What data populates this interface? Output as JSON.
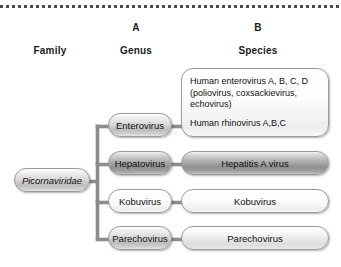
{
  "diagram": {
    "top_rule_style": "dotted",
    "columns": [
      {
        "letter": "",
        "header": "Family"
      },
      {
        "letter": "A",
        "header": "Genus"
      },
      {
        "letter": "B",
        "header": "Species"
      }
    ],
    "family": {
      "label": "Picornaviridae",
      "italic": true
    },
    "branches": [
      {
        "genus": "Enterovirus",
        "species_lines": [
          "Human enterovirus A, B, C, D",
          "(poliovirus, coxsackievirus,",
          "echovirus)",
          "Human rhinovirus A,B,C"
        ]
      },
      {
        "genus": "Hepatovirus",
        "species_lines": [
          "Hepatitis A virus"
        ]
      },
      {
        "genus": "Kobuvirus",
        "species_lines": [
          "Kobuvirus"
        ]
      },
      {
        "genus": "Parechovirus",
        "species_lines": [
          "Parechovirus"
        ]
      }
    ],
    "colors": {
      "line": "#8d8d8d",
      "border": "#9a9a9a",
      "text": "#111111",
      "rule": "#4a4a4a",
      "background": "#ffffff"
    }
  }
}
